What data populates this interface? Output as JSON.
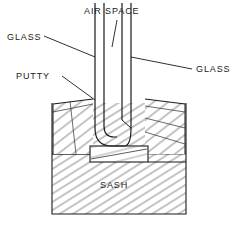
{
  "diagram": {
    "labels": {
      "air_space": "AIR SPACE",
      "glass_left": "GLASS",
      "glass_right": "GLASS",
      "putty": "PUTTY",
      "sash": "SASH"
    },
    "colors": {
      "line": "#1a1a1a",
      "hatch": "#555555",
      "background": "#ffffff",
      "text": "#1a1a1a"
    },
    "parts": [
      {
        "name": "glass-pane-left",
        "kind": "glass"
      },
      {
        "name": "glass-pane-right",
        "kind": "glass"
      },
      {
        "name": "air-space-gap",
        "kind": "void"
      },
      {
        "name": "sealed-unit-bottom",
        "kind": "seal"
      },
      {
        "name": "setting-block",
        "kind": "block"
      },
      {
        "name": "putty-wedge-left",
        "kind": "putty"
      },
      {
        "name": "putty-wedge-right",
        "kind": "putty"
      },
      {
        "name": "sash-body",
        "kind": "wood"
      }
    ]
  }
}
